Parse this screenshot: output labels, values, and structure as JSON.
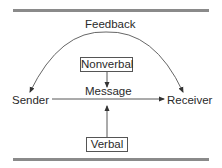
{
  "diagram": {
    "type": "communication-model",
    "nodes": {
      "feedback": "Feedback",
      "nonverbal": "Nonverbal",
      "message": "Message",
      "sender": "Sender",
      "receiver": "Receiver",
      "verbal": "Verbal"
    },
    "edges": [
      {
        "from": "sender",
        "to": "receiver",
        "label": "Message"
      },
      {
        "from": "nonverbal",
        "to": "message"
      },
      {
        "from": "verbal",
        "to": "message"
      },
      {
        "from": "receiver",
        "to": "sender",
        "label": "Feedback",
        "style": "arc"
      }
    ],
    "colors": {
      "rule": "#8a8a8a",
      "line": "#444444",
      "text": "#2a2a2a"
    }
  }
}
